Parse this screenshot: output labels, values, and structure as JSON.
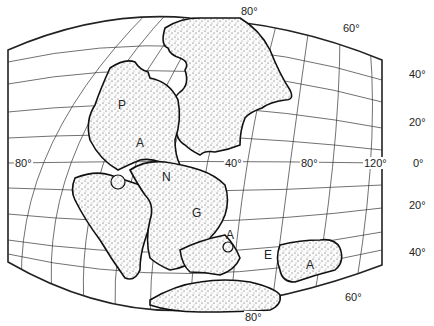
{
  "map": {
    "title": "Pangaea",
    "continent_letters": [
      "P",
      "A",
      "N",
      "G",
      "A",
      "E",
      "A"
    ],
    "longitude_labels": [
      "80°",
      "40°",
      "80°",
      "120°"
    ],
    "latitude_labels_right": [
      "40°",
      "20°",
      "0°",
      "20°",
      "40°"
    ],
    "top_labels": [
      "80°",
      "60°"
    ],
    "bottom_labels": [
      "60°",
      "80°"
    ],
    "land_fill": "#f4f4f4",
    "stipple_color": "#333333",
    "grid_color": "#333333"
  }
}
